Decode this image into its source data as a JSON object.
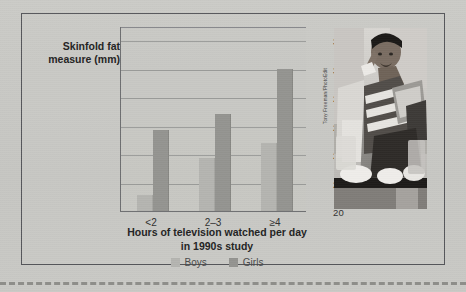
{
  "figure": {
    "photo": {
      "credit": "Tony Freeman/PhotoEdit",
      "alt_description": "boy eating snacks on couch watching television"
    }
  },
  "colors": {
    "page_background": "#c8c8c4",
    "frame_border": "#55565a",
    "axis": "#6d6e70",
    "gridline": "#9b9c9a",
    "boys_bar": "#b4b4b0",
    "girls_bar": "#949490",
    "text": "#232323",
    "dashed_rule": "#8e8e8a"
  },
  "chart_data": {
    "type": "bar",
    "title": "",
    "categories": [
      "<2",
      "2–3",
      "≥4"
    ],
    "series": [
      {
        "name": "Boys",
        "color": "#b4b4b0",
        "values": [
          21.1,
          23.7,
          24.8
        ]
      },
      {
        "name": "Girls",
        "color": "#949490",
        "values": [
          25.7,
          26.8,
          30.0
        ]
      }
    ],
    "xlabel": "Hours of television watched per day in 1990s study",
    "xlabel_lines": [
      "Hours of television watched per day",
      "in 1990s study"
    ],
    "ylabel": "Skinfold fat measure (mm)",
    "ylabel_lines": [
      "Skinfold fat",
      "measure (mm)"
    ],
    "ylim": [
      20,
      33
    ],
    "yticks": [
      20,
      22,
      24,
      26,
      28,
      30,
      32
    ],
    "ytick_labels": [
      "20",
      "22",
      "24",
      "26",
      "28",
      "30",
      "32"
    ],
    "grid": true,
    "grid_axis": "y",
    "legend_position": "bottom-center",
    "legend_entries": [
      "Boys",
      "Girls"
    ]
  }
}
